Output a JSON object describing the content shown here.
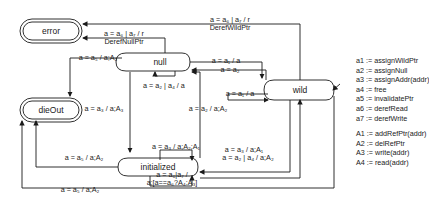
{
  "states": {
    "error": "error",
    "dieOut": "dieOut",
    "null": "null",
    "wild": "wild",
    "initialized": "initialized"
  },
  "transitions": {
    "wild_to_error": "a = a₆ | a₇ / r",
    "wild_to_error_2": "DerefWildPtr",
    "null_to_error": "a = a₆ | a₇ / r",
    "null_to_error_2": "DerefNullPtr",
    "null_to_dieout": "a = a₅ / a;A₂",
    "null_self": "a = a₂ | a₄ / a",
    "null_to_wild": "a = a₁ / a",
    "wild_to_null": "a = a₂",
    "wild_self": "a = a₁ / a",
    "null_to_initialized": "a = a₃ / a;A₃",
    "initialized_to_null": "a = a₂ / a;A₂",
    "initialized_self_1": "a = a₃ / a;A₂;A₁",
    "initialized_to_dieout": "a = a₅ / a;A₂",
    "initialized_self_2a": "a = a₆|a₇ /",
    "initialized_self_2b": "a;[a==a₆?A₄:A₃]",
    "wild_to_initialized": "a = a₃ / a;A₁",
    "initialized_to_wild": "a = a₂ | a₄ / a;A₂",
    "wild_to_dieout": "a = a₅ / a;A₂"
  },
  "legend": {
    "actions": [
      "a1 := assignWildPtr",
      "a2 := assignNull",
      "a3 := assignAddr(addr)",
      "a4 := free",
      "a5 := invalidatePtr",
      "a6 := derefRead",
      "a7 := derefWrite"
    ],
    "effects": [
      "A1 := addRefPtr(addr)",
      "A2 := delRefPtr",
      "A3 := write(addr)",
      "A4 := read(addr)"
    ]
  }
}
